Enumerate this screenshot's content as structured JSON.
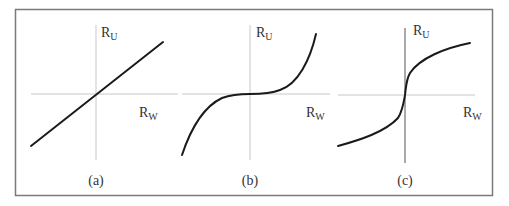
{
  "figure": {
    "frame_color": "#7a7a7a",
    "axis_color": "#c8c8c8",
    "axis_color_dark": "#555555",
    "curve_color": "#1a1a1a",
    "panels": [
      {
        "id": "a",
        "caption": "(a)",
        "y_label": "R",
        "y_label_sub": "U",
        "x_label": "R",
        "x_label_sub": "W",
        "shape": "linear"
      },
      {
        "id": "b",
        "caption": "(b)",
        "y_label": "R",
        "y_label_sub": "U",
        "x_label": "R",
        "x_label_sub": "W",
        "shape": "cubic"
      },
      {
        "id": "c",
        "caption": "(c)",
        "y_label": "R",
        "y_label_sub": "U",
        "x_label": "R",
        "x_label_sub": "W",
        "shape": "cube-root"
      }
    ]
  }
}
